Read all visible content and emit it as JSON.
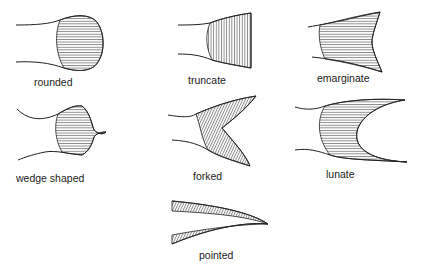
{
  "figures": [
    {
      "id": "rounded",
      "label": "rounded"
    },
    {
      "id": "truncate",
      "label": "truncate"
    },
    {
      "id": "emarginate",
      "label": "emarginate"
    },
    {
      "id": "wedge_shaped",
      "label": "wedge shaped"
    },
    {
      "id": "forked",
      "label": "forked"
    },
    {
      "id": "lunate",
      "label": "lunate"
    },
    {
      "id": "pointed",
      "label": "pointed"
    }
  ],
  "colors": {
    "ink": "#222222",
    "background": "#ffffff"
  }
}
